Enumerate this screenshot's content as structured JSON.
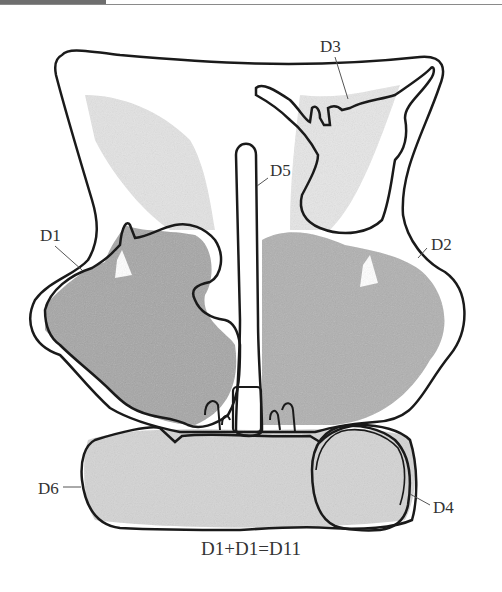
{
  "figure": {
    "labels": {
      "d1": "D1",
      "d2": "D2",
      "d3": "D3",
      "d4": "D4",
      "d5": "D5",
      "d6": "D6"
    },
    "caption": "D1+D1=D11"
  },
  "colors": {
    "outline": "#1a1a1a",
    "leader": "#555555",
    "fill_dark": "#a9a9a9",
    "fill_light": "#d6d6d6",
    "text": "#333333"
  }
}
